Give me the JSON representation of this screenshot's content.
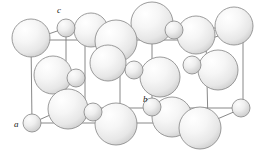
{
  "figure": {
    "background_color": "#ffffff",
    "cell_edge_color": "#7a7a7a",
    "sphere_outline_color": "#8a8a8a",
    "sphere_fill_light": "#fdfdfd",
    "sphere_fill_shadow": "#d2d2d2",
    "width": 274,
    "height": 150
  },
  "axes": [
    {
      "id": "a",
      "label": "a",
      "x": 14,
      "y": 127
    },
    {
      "id": "b",
      "label": "b",
      "x": 143,
      "y": 102
    },
    {
      "id": "c",
      "label": "c",
      "x": 57,
      "y": 13
    }
  ],
  "cell_edges": [
    {
      "x1": 31,
      "y1": 40,
      "x2": 32,
      "y2": 123
    },
    {
      "x1": 31,
      "y1": 40,
      "x2": 66,
      "y2": 28
    },
    {
      "x1": 66,
      "y1": 28,
      "x2": 66,
      "y2": 108
    },
    {
      "x1": 32,
      "y1": 123,
      "x2": 66,
      "y2": 108
    },
    {
      "x1": 31,
      "y1": 40,
      "x2": 206,
      "y2": 40
    },
    {
      "x1": 32,
      "y1": 123,
      "x2": 208,
      "y2": 123
    },
    {
      "x1": 66,
      "y1": 28,
      "x2": 243,
      "y2": 28
    },
    {
      "x1": 66,
      "y1": 108,
      "x2": 243,
      "y2": 108
    },
    {
      "x1": 206,
      "y1": 40,
      "x2": 208,
      "y2": 123
    },
    {
      "x1": 206,
      "y1": 40,
      "x2": 243,
      "y2": 28
    },
    {
      "x1": 243,
      "y1": 28,
      "x2": 243,
      "y2": 108
    },
    {
      "x1": 208,
      "y1": 123,
      "x2": 243,
      "y2": 108
    },
    {
      "x1": 120,
      "y1": 34,
      "x2": 120,
      "y2": 116
    },
    {
      "x1": 152,
      "y1": 28,
      "x2": 152,
      "y2": 108
    },
    {
      "x1": 85,
      "y1": 34,
      "x2": 85,
      "y2": 116
    }
  ],
  "large_spheres": [
    {
      "cx": 31,
      "cy": 38,
      "r": 19
    },
    {
      "cx": 91,
      "cy": 30,
      "r": 17
    },
    {
      "cx": 116,
      "cy": 41,
      "r": 21
    },
    {
      "cx": 152,
      "cy": 23,
      "r": 21
    },
    {
      "cx": 196,
      "cy": 35,
      "r": 19
    },
    {
      "cx": 234,
      "cy": 26,
      "r": 19
    },
    {
      "cx": 53,
      "cy": 75,
      "r": 19
    },
    {
      "cx": 108,
      "cy": 63,
      "r": 18
    },
    {
      "cx": 160,
      "cy": 77,
      "r": 20
    },
    {
      "cx": 218,
      "cy": 70,
      "r": 20
    },
    {
      "cx": 68,
      "cy": 109,
      "r": 20
    },
    {
      "cx": 116,
      "cy": 124,
      "r": 21
    },
    {
      "cx": 172,
      "cy": 117,
      "r": 20
    },
    {
      "cx": 200,
      "cy": 128,
      "r": 21
    }
  ],
  "small_spheres": [
    {
      "cx": 66,
      "cy": 28,
      "r": 9
    },
    {
      "cx": 174,
      "cy": 30,
      "r": 9
    },
    {
      "cx": 76,
      "cy": 78,
      "r": 9
    },
    {
      "cx": 134,
      "cy": 70,
      "r": 9
    },
    {
      "cx": 192,
      "cy": 65,
      "r": 9
    },
    {
      "cx": 32,
      "cy": 123,
      "r": 9
    },
    {
      "cx": 93,
      "cy": 112,
      "r": 9
    },
    {
      "cx": 152,
      "cy": 107,
      "r": 9
    },
    {
      "cx": 241,
      "cy": 108,
      "r": 9
    }
  ]
}
